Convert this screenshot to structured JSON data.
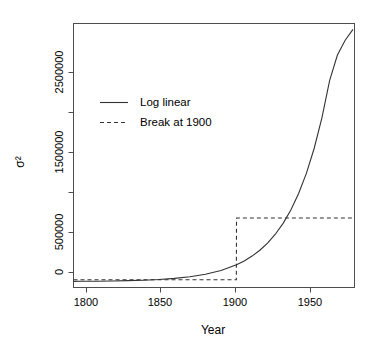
{
  "chart_data": {
    "type": "line",
    "title": "",
    "xlabel": "Year",
    "ylabel": "σ²",
    "xlim": [
      1795,
      1976
    ],
    "ylim": [
      -60000,
      2620000
    ],
    "xticks": [
      1800,
      1850,
      1900,
      1950
    ],
    "xtick_labels": [
      "1800",
      "1850",
      "1900",
      "1950"
    ],
    "yticks": [
      0,
      500000,
      1000000,
      1500000,
      2000000,
      2500000
    ],
    "ytick_labels": [
      "0",
      "500000",
      "",
      "1500000",
      "",
      "2500000"
    ],
    "grid": false,
    "legend_position": "upper-left",
    "series": [
      {
        "name": "Log linear",
        "style": "solid",
        "color": "#333333",
        "x": [
          1795,
          1800,
          1810,
          1820,
          1830,
          1840,
          1850,
          1860,
          1870,
          1880,
          1890,
          1900,
          1905,
          1910,
          1915,
          1920,
          1925,
          1930,
          1935,
          1940,
          1945,
          1950,
          1955,
          1960,
          1965,
          1970,
          1975
        ],
        "y": [
          2200,
          2700,
          4100,
          6200,
          9400,
          14200,
          21500,
          32600,
          49300,
          74600,
          113000,
          171000,
          210000,
          259000,
          318000,
          391000,
          481000,
          591000,
          727000,
          894000,
          1099000,
          1351000,
          1661000,
          2042000,
          2300000,
          2450000,
          2560000
        ]
      },
      {
        "name": "Break at 1900",
        "style": "dashed",
        "color": "#333333",
        "x": [
          1795,
          1899.9,
          1900,
          1975
        ],
        "y": [
          18000,
          18000,
          645000,
          645000
        ]
      }
    ],
    "legend_entries": [
      {
        "label": "Log linear",
        "style": "solid"
      },
      {
        "label": "Break at 1900",
        "style": "dashed"
      }
    ],
    "annotations": []
  }
}
